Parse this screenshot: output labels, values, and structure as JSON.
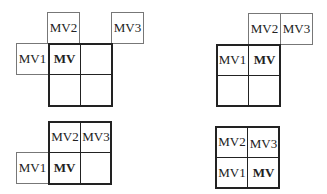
{
  "diagrams": [
    {
      "id": "top-left",
      "cells": {
        "mv1": "MV1",
        "mv2": "MV2",
        "mv3": "MV3",
        "mv": "MV"
      }
    },
    {
      "id": "top-right",
      "cells": {
        "mv1": "MV1",
        "mv2": "MV2",
        "mv3": "MV3",
        "mv": "MV"
      }
    },
    {
      "id": "bottom-left",
      "cells": {
        "mv1": "MV1",
        "mv2": "MV2",
        "mv3": "MV3",
        "mv": "MV"
      }
    },
    {
      "id": "bottom-right",
      "cells": {
        "mv1": "MV1",
        "mv2": "MV2",
        "mv3": "MV3",
        "mv": "MV"
      }
    }
  ]
}
